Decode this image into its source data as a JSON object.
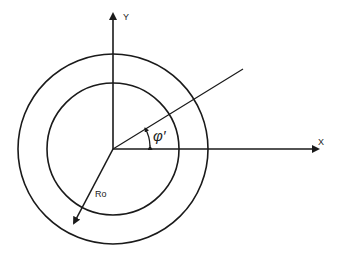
{
  "diagram": {
    "labels": {
      "y_axis": "Y",
      "x_axis": "X",
      "angle": "φ′",
      "radius": "Ro"
    },
    "colors": {
      "stroke": "#1a1a1a",
      "background": "#ffffff"
    }
  }
}
